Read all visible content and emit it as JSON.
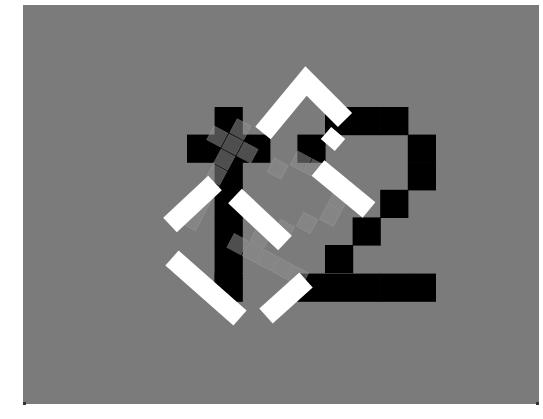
{
  "stimulus": {
    "description": "Grey panel with black pixel glyph '+2', two rotated white square outlines and a translucent tilted grey copy of the glyph",
    "glyph_text": "+2",
    "colors": {
      "page_background": "#ffffff",
      "panel": "#7b7b7b",
      "glyph": "#000000",
      "frames": "#ffffff",
      "overlay": "#8e8e8e"
    },
    "panel": {
      "x": 23,
      "y": 5,
      "width": 516,
      "height": 399
    },
    "cell_size": 27.6,
    "glyph_origin": {
      "x": 187,
      "y": 107
    },
    "glyph_cells": [
      [
        1,
        0
      ],
      [
        1,
        1
      ],
      [
        1,
        2
      ],
      [
        1,
        3
      ],
      [
        1,
        4
      ],
      [
        1,
        5
      ],
      [
        1,
        6
      ],
      [
        0,
        1
      ],
      [
        2,
        1
      ],
      [
        5,
        0
      ],
      [
        6,
        0
      ],
      [
        7,
        0
      ],
      [
        4,
        1
      ],
      [
        8,
        1
      ],
      [
        8,
        2
      ],
      [
        7,
        3
      ],
      [
        6,
        4
      ],
      [
        5,
        5
      ],
      [
        4,
        6
      ],
      [
        5,
        6
      ],
      [
        6,
        6
      ],
      [
        7,
        6
      ],
      [
        8,
        6
      ]
    ],
    "frames": [
      {
        "name": "upper-right-frame",
        "points": "263,133 306,81 345,120"
      },
      {
        "name": "upper-right-frame-lower-arm",
        "points": "318,168 369,210"
      },
      {
        "name": "upper-right-frame-small-square",
        "points": "326,133 340,145"
      },
      {
        "name": "lower-left-frame-upper-arm",
        "points": "170,225 215,183"
      },
      {
        "name": "lower-left-frame-inner-arm",
        "points": "235,196 285,243"
      },
      {
        "name": "lower-left-frame-bottom-left",
        "points": "172,258 240,318"
      },
      {
        "name": "lower-left-frame-bottom-right",
        "points": "266,316 306,280"
      }
    ],
    "overlay": {
      "rotation_deg": 28,
      "opacity": 0.55,
      "cx": 262,
      "cy": 200
    }
  }
}
